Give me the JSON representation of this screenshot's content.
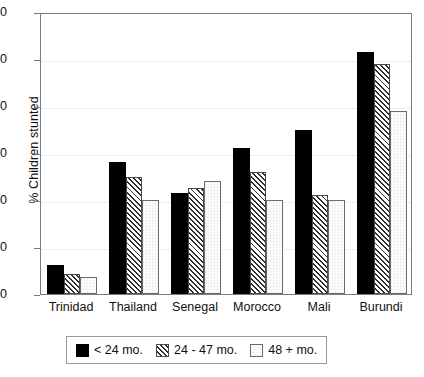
{
  "chart_data": {
    "type": "bar",
    "title": "",
    "subtitle": "",
    "xlabel": "",
    "ylabel": "% Children stunted",
    "ylim": [
      0,
      60
    ],
    "yticks": [
      0,
      10,
      20,
      30,
      40,
      50,
      60
    ],
    "ytick_labels": [
      "0",
      "10",
      "20",
      "30",
      "40",
      "50",
      "60"
    ],
    "grid": true,
    "grid_axis": "y",
    "legend_position": "bottom",
    "categories": [
      "Trinidad",
      "Thailand",
      "Senegal",
      "Morocco",
      "Mali",
      "Burundi"
    ],
    "series": [
      {
        "name": "< 24 mo.",
        "pattern": "solid-black",
        "values": [
          6.2,
          28.0,
          21.5,
          31.0,
          35.0,
          51.5
        ]
      },
      {
        "name": "24 - 47 mo.",
        "pattern": "diagonal-hatch",
        "values": [
          4.2,
          25.0,
          22.5,
          26.0,
          21.0,
          49.0
        ]
      },
      {
        "name": "48 + mo.",
        "pattern": "open-white",
        "values": [
          3.7,
          20.0,
          24.0,
          20.0,
          20.0,
          39.0
        ]
      }
    ]
  },
  "colors": {
    "series_0": "#000000",
    "series_1": "#2e2e2e",
    "series_2": "#ffffff",
    "axis": "#7a7a7a",
    "grid": "#dedede",
    "text": "#111111"
  }
}
